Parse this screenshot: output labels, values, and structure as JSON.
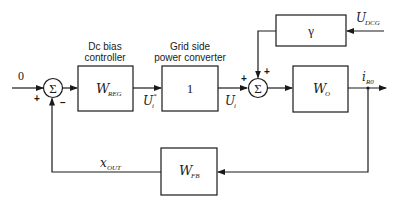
{
  "diagram": {
    "type": "control-block-diagram",
    "input": {
      "label": "0"
    },
    "sum1": {
      "symbol": "Σ",
      "signs": {
        "left": "+",
        "bottom": "−"
      }
    },
    "sum2": {
      "symbol": "Σ",
      "signs": {
        "left": "+",
        "top": "+"
      }
    },
    "blocks": {
      "reg": {
        "caption_line1": "Dc bias",
        "caption_line2": "controller",
        "main": "W",
        "sub": "REG"
      },
      "conv": {
        "caption_line1": "Grid side",
        "caption_line2": "power converter",
        "main": "1"
      },
      "gamma": {
        "main": "γ"
      },
      "wo": {
        "main": "W",
        "sub": "O"
      },
      "fb": {
        "main": "W",
        "sub": "FB"
      }
    },
    "signals": {
      "ui_star": {
        "main": "U",
        "sub": "i",
        "sup": "*"
      },
      "ui": {
        "main": "U",
        "sub": "i"
      },
      "udcg": {
        "main": "U",
        "sub": "DCG"
      },
      "ir0": {
        "main": "i",
        "sub": "R0"
      },
      "xout": {
        "main": "x",
        "sub": "OUT"
      }
    }
  }
}
